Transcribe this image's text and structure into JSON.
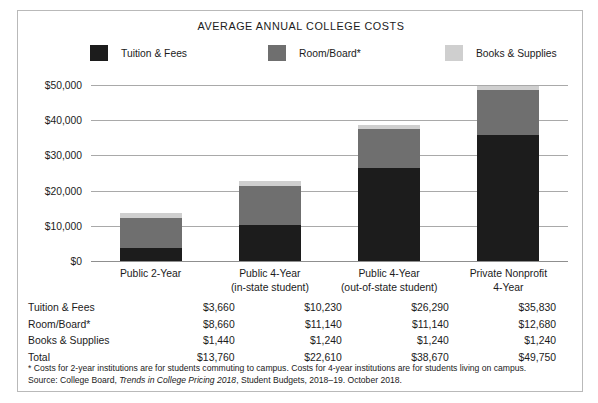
{
  "chart_data": {
    "type": "bar",
    "subtype": "stacked",
    "title": "AVERAGE ANNUAL COLLEGE COSTS",
    "xlabel": "",
    "ylabel": "",
    "ylim": [
      0,
      50000
    ],
    "yticks": [
      0,
      10000,
      20000,
      30000,
      40000,
      50000
    ],
    "ytick_labels": [
      "$0",
      "$10,000",
      "$20,000",
      "$30,000",
      "$40,000",
      "$50,000"
    ],
    "grid": true,
    "legend_position": "top",
    "categories": [
      "Public 2-Year",
      "Public 4-Year\n(in-state student)",
      "Public 4-Year\n(out-of-state student)",
      "Private Nonprofit\n4-Year"
    ],
    "category_lines": [
      [
        "Public 2-Year",
        ""
      ],
      [
        "Public 4-Year",
        "(in-state student)"
      ],
      [
        "Public 4-Year",
        "(out-of-state student)"
      ],
      [
        "Private Nonprofit",
        "4-Year"
      ]
    ],
    "series": [
      {
        "name": "Tuition & Fees",
        "color": "#1c1c1c",
        "values": [
          3660,
          10230,
          26290,
          35830
        ]
      },
      {
        "name": "Room/Board*",
        "color": "#6f6f6f",
        "values": [
          8660,
          11140,
          11140,
          12680
        ]
      },
      {
        "name": "Books & Supplies",
        "color": "#cfcfcf",
        "values": [
          1440,
          1240,
          1240,
          1240
        ]
      }
    ],
    "totals": [
      13760,
      22610,
      38670,
      49750
    ]
  },
  "legend": {
    "items": [
      {
        "label": "Tuition & Fees",
        "color": "#1c1c1c"
      },
      {
        "label": "Room/Board*",
        "color": "#6f6f6f"
      },
      {
        "label": "Books & Supplies",
        "color": "#cfcfcf"
      }
    ]
  },
  "table": {
    "rows": [
      {
        "label": "Tuition & Fees",
        "values": [
          "$3,660",
          "$10,230",
          "$26,290",
          "$35,830"
        ]
      },
      {
        "label": "Room/Board*",
        "values": [
          "$8,660",
          "$11,140",
          "$11,140",
          "$12,680"
        ]
      },
      {
        "label": "Books & Supplies",
        "values": [
          "$1,440",
          "$1,240",
          "$1,240",
          "$1,240"
        ]
      },
      {
        "label": "Total",
        "values": [
          "$13,760",
          "$22,610",
          "$38,670",
          "$49,750"
        ]
      }
    ]
  },
  "footnotes": {
    "note1": "* Costs for 2-year institutions are for students commuting to campus. Costs for 4-year institutions are for students living on campus.",
    "source_prefix": "Source: College Board, ",
    "source_italic": "Trends in College Pricing 2018",
    "source_suffix": ", Student Budgets, 2018–19. October 2018."
  }
}
